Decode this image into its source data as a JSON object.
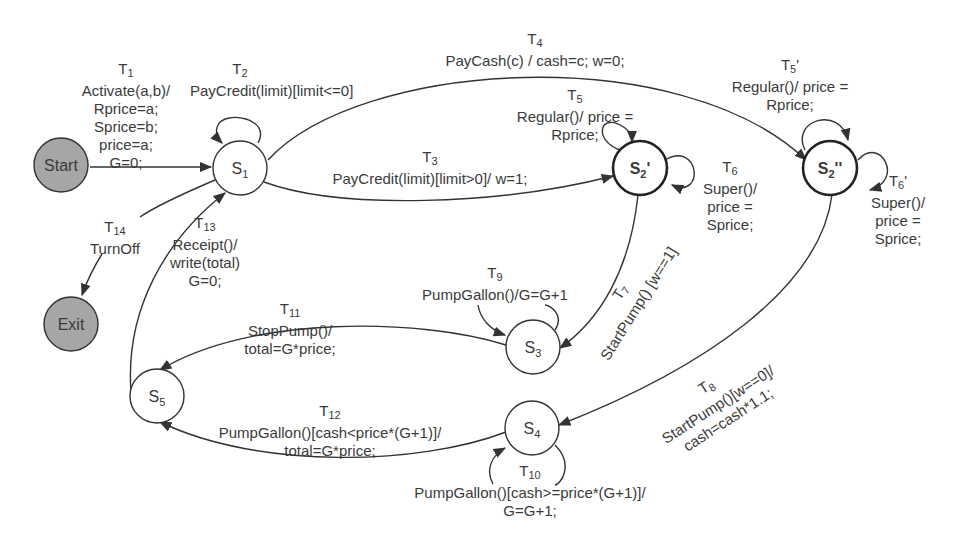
{
  "diagram": {
    "type": "state-machine",
    "states": [
      {
        "id": "start",
        "label": "Start",
        "kind": "initial",
        "fill": "#a6a6a6"
      },
      {
        "id": "s1",
        "label": "S",
        "sub": "1",
        "kind": "normal"
      },
      {
        "id": "s2p",
        "label": "S",
        "sub": "2",
        "suffix": "'",
        "kind": "bold"
      },
      {
        "id": "s2pp",
        "label": "S",
        "sub": "2",
        "suffix": "''",
        "kind": "bold"
      },
      {
        "id": "s3",
        "label": "S",
        "sub": "3",
        "kind": "normal"
      },
      {
        "id": "s4",
        "label": "S",
        "sub": "4",
        "kind": "normal"
      },
      {
        "id": "s5",
        "label": "S",
        "sub": "5",
        "kind": "normal"
      },
      {
        "id": "exit",
        "label": "Exit",
        "kind": "final",
        "fill": "#a6a6a6"
      }
    ],
    "transitions": [
      {
        "id": "T",
        "sub": "1",
        "from": "start",
        "to": "s1",
        "lines": [
          "Activate(a,b)/",
          "Rprice=a;",
          "Sprice=b;",
          "price=a;",
          "G=0;"
        ]
      },
      {
        "id": "T",
        "sub": "2",
        "from": "s1",
        "to": "s1",
        "lines": [
          "PayCredit(limit)[limit<=0]"
        ]
      },
      {
        "id": "T",
        "sub": "3",
        "from": "s1",
        "to": "s2p",
        "lines": [
          "PayCredit(limit)[limit>0]/ w=1;"
        ]
      },
      {
        "id": "T",
        "sub": "4",
        "from": "s1",
        "to": "s2pp",
        "lines": [
          "PayCash(c) / cash=c;  w=0;"
        ]
      },
      {
        "id": "T",
        "sub": "5",
        "from": "s2p",
        "to": "s2p",
        "lines": [
          "Regular()/ price =",
          "Rprice;"
        ]
      },
      {
        "id": "T",
        "sub": "5",
        "suffix": "'",
        "from": "s2pp",
        "to": "s2pp",
        "lines": [
          "Regular()/ price =",
          "Rprice;"
        ]
      },
      {
        "id": "T",
        "sub": "6",
        "from": "s2p",
        "to": "s2p",
        "lines": [
          "Super()/",
          "price =",
          "Sprice;"
        ]
      },
      {
        "id": "T",
        "sub": "6",
        "suffix": "'",
        "from": "s2pp",
        "to": "s2pp",
        "lines": [
          "Super()/",
          "price =",
          "Sprice;"
        ]
      },
      {
        "id": "T",
        "sub": "7",
        "from": "s2p",
        "to": "s3",
        "lines": [
          "StartPump() [w==1]"
        ]
      },
      {
        "id": "T",
        "sub": "8",
        "from": "s2pp",
        "to": "s4",
        "lines": [
          "StartPump()[w==0]/",
          "cash=cash*1.1;"
        ]
      },
      {
        "id": "T",
        "sub": "9",
        "from": "s3",
        "to": "s3",
        "lines": [
          "PumpGallon()/G=G+1"
        ]
      },
      {
        "id": "T",
        "sub": "10",
        "from": "s4",
        "to": "s4",
        "lines": [
          "PumpGallon()[cash>=price*(G+1)]/",
          "G=G+1;"
        ]
      },
      {
        "id": "T",
        "sub": "11",
        "from": "s3",
        "to": "s5",
        "lines": [
          "StopPump()/",
          "total=G*price;"
        ]
      },
      {
        "id": "T",
        "sub": "12",
        "from": "s4",
        "to": "s5",
        "lines": [
          "PumpGallon()[cash<price*(G+1)]/",
          "total=G*price;"
        ]
      },
      {
        "id": "T",
        "sub": "13",
        "from": "s5",
        "to": "s1",
        "lines": [
          "Receipt()/",
          "write(total)",
          "G=0;"
        ]
      },
      {
        "id": "T",
        "sub": "14",
        "from": "s1",
        "to": "exit",
        "lines": [
          "TurnOff"
        ]
      }
    ]
  }
}
